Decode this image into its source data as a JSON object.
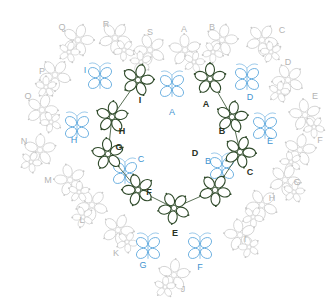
{
  "diagram": {
    "colors": {
      "inner_flowers": "#2f4a2a",
      "butterflies": "#5aa6dc",
      "outer_ring": "#c8c8c8",
      "label_dark": "#2a3326",
      "label_blue": "#3f94d0",
      "label_gray": "#b4b4b4"
    },
    "inner_flowers": [
      {
        "label": "A",
        "cx": 210,
        "cy": 79,
        "lx": 206,
        "ly": 104
      },
      {
        "label": "B",
        "cx": 232,
        "cy": 117,
        "lx": 222,
        "ly": 131
      },
      {
        "label": "C",
        "cx": 240,
        "cy": 152,
        "lx": 250,
        "ly": 172
      },
      {
        "label": "D",
        "cx": 215,
        "cy": 190,
        "lx": 195,
        "ly": 153
      },
      {
        "label": "E",
        "cx": 174,
        "cy": 208,
        "lx": 175,
        "ly": 233
      },
      {
        "label": "F",
        "cx": 138,
        "cy": 190,
        "lx": 149,
        "ly": 192
      },
      {
        "label": "G",
        "cx": 108,
        "cy": 154,
        "lx": 119,
        "ly": 147
      },
      {
        "label": "H",
        "cx": 112,
        "cy": 117,
        "lx": 122,
        "ly": 131
      },
      {
        "label": "I",
        "cx": 138,
        "cy": 80,
        "lx": 140,
        "ly": 100
      }
    ],
    "butterflies": [
      {
        "label": "A",
        "cx": 172,
        "cy": 86,
        "lx": 172,
        "ly": 112
      },
      {
        "label": "D",
        "cx": 247,
        "cy": 79,
        "lx": 250,
        "ly": 97
      },
      {
        "label": "E",
        "cx": 265,
        "cy": 128,
        "lx": 270,
        "ly": 141
      },
      {
        "label": "B",
        "cx": 222,
        "cy": 168,
        "lx": 208,
        "ly": 161
      },
      {
        "label": "F",
        "cx": 200,
        "cy": 248,
        "lx": 200,
        "ly": 267
      },
      {
        "label": "G",
        "cx": 148,
        "cy": 248,
        "lx": 143,
        "ly": 265
      },
      {
        "label": "C",
        "cx": 125,
        "cy": 173,
        "lx": 141,
        "ly": 159
      },
      {
        "label": "H",
        "cx": 77,
        "cy": 127,
        "lx": 74,
        "ly": 140
      },
      {
        "label": "I",
        "cx": 100,
        "cy": 78,
        "lx": 85,
        "ly": 70
      }
    ],
    "outer_ring": [
      {
        "label": "Q",
        "cx": 78,
        "cy": 40,
        "lx": 62,
        "ly": 27
      },
      {
        "label": "R",
        "cx": 115,
        "cy": 38,
        "lx": 106,
        "ly": 24
      },
      {
        "label": "S",
        "cx": 150,
        "cy": 50,
        "lx": 150,
        "ly": 32
      },
      {
        "label": "A",
        "cx": 185,
        "cy": 50,
        "lx": 184,
        "ly": 29
      },
      {
        "label": "B",
        "cx": 222,
        "cy": 40,
        "lx": 212,
        "ly": 27
      },
      {
        "label": "C",
        "cx": 262,
        "cy": 40,
        "lx": 282,
        "ly": 30
      },
      {
        "label": "D",
        "cx": 288,
        "cy": 80,
        "lx": 288,
        "ly": 62
      },
      {
        "label": "E",
        "cx": 305,
        "cy": 115,
        "lx": 315,
        "ly": 96
      },
      {
        "label": "F",
        "cx": 300,
        "cy": 150,
        "lx": 320,
        "ly": 140
      },
      {
        "label": "G",
        "cx": 285,
        "cy": 180,
        "lx": 297,
        "ly": 182
      },
      {
        "label": "H",
        "cx": 262,
        "cy": 205,
        "lx": 272,
        "ly": 198
      },
      {
        "label": "I",
        "cx": 240,
        "cy": 235,
        "lx": 245,
        "ly": 239
      },
      {
        "label": "J",
        "cx": 174,
        "cy": 275,
        "lx": 183,
        "ly": 289
      },
      {
        "label": "K",
        "cx": 118,
        "cy": 230,
        "lx": 116,
        "ly": 253
      },
      {
        "label": "L",
        "cx": 92,
        "cy": 205,
        "lx": 82,
        "ly": 220
      },
      {
        "label": "M",
        "cx": 70,
        "cy": 180,
        "lx": 48,
        "ly": 180
      },
      {
        "label": "N",
        "cx": 40,
        "cy": 150,
        "lx": 24,
        "ly": 141
      },
      {
        "label": "O",
        "cx": 42,
        "cy": 110,
        "lx": 28,
        "ly": 96
      },
      {
        "label": "P",
        "cx": 55,
        "cy": 75,
        "lx": 42,
        "ly": 71
      }
    ]
  }
}
